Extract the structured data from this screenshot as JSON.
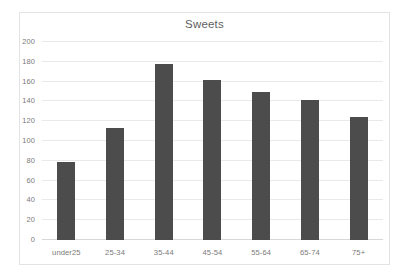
{
  "chart_data": {
    "type": "bar",
    "title": "Sweets",
    "xlabel": "",
    "ylabel": "",
    "categories": [
      "under25",
      "25-34",
      "35-44",
      "45-54",
      "55-64",
      "65-74",
      "75+"
    ],
    "values": [
      79,
      113,
      178,
      162,
      150,
      141,
      124
    ],
    "ylim": [
      0,
      200
    ],
    "ytick_step": 20,
    "ytick_labels": [
      "0",
      "20",
      "40",
      "60",
      "80",
      "100",
      "120",
      "140",
      "160",
      "180",
      "200"
    ],
    "grid": true,
    "legend": false,
    "legend_position": "none",
    "series": [
      {
        "name": "Sweets",
        "values": [
          79,
          113,
          178,
          162,
          150,
          141,
          124
        ]
      }
    ],
    "colors": {
      "bar": "#4c4c4c",
      "gridline": "#e9e9e9",
      "axis": "#d8d8d8",
      "tick_text": "#7a7a7a",
      "title_text": "#5f5f5f",
      "frame": "#e3e3e3",
      "background": "#ffffff"
    }
  }
}
